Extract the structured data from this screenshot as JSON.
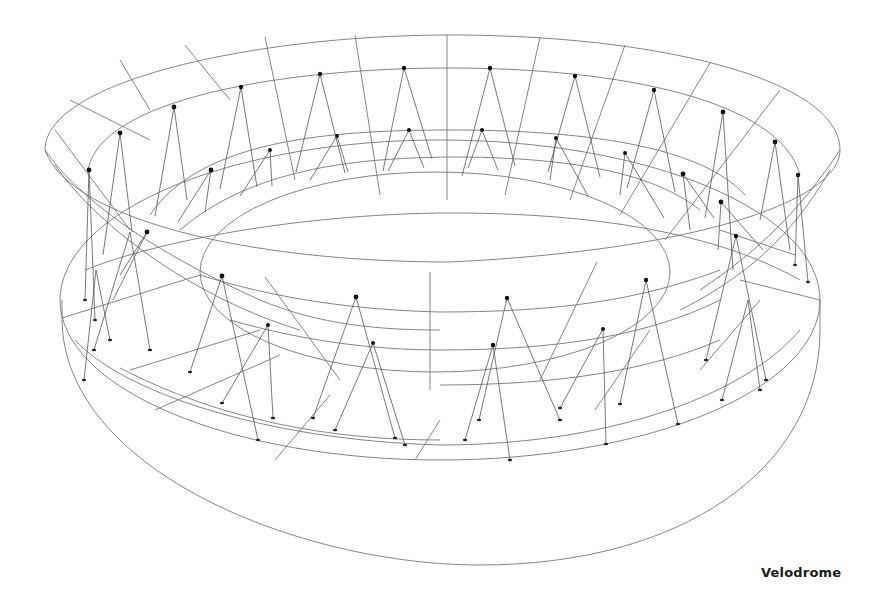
{
  "caption": "Velodrome",
  "drawing": {
    "subject": "velodrome-axonometric-line-drawing",
    "line_color": "#777777",
    "node_color": "#111111",
    "background": "#ffffff"
  }
}
